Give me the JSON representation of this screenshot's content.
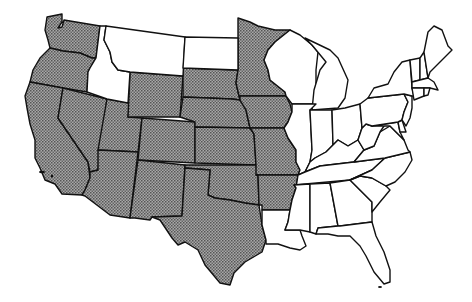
{
  "map": {
    "type": "choropleth",
    "region": "Contiguous United States",
    "legend": null,
    "colors": {
      "shaded": "#8a8a8a",
      "unshaded": "#ffffff",
      "border": "#111111"
    },
    "shaded_states": [
      "WA",
      "OR",
      "CA",
      "NV",
      "UT",
      "AZ",
      "WY",
      "CO",
      "NM",
      "SD",
      "NE",
      "KS",
      "OK",
      "TX",
      "MN",
      "IA",
      "MO",
      "AR"
    ],
    "unshaded_states": [
      "ID",
      "MT",
      "ND",
      "LA",
      "WI",
      "MI",
      "IL",
      "IN",
      "OH",
      "KY",
      "TN",
      "MS",
      "AL",
      "GA",
      "FL",
      "SC",
      "NC",
      "VA",
      "WV",
      "MD",
      "DE",
      "PA",
      "NJ",
      "NY",
      "CT",
      "RI",
      "MA",
      "VT",
      "NH",
      "ME"
    ]
  }
}
